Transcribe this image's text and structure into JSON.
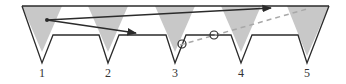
{
  "diagram": {
    "labels": [
      {
        "text": "1",
        "x": 42
      },
      {
        "text": "2",
        "x": 108
      },
      {
        "text": "3",
        "x": 175
      },
      {
        "text": "4",
        "x": 241
      },
      {
        "text": "5",
        "x": 307
      }
    ],
    "colors": {
      "outline": "#2b2b2b",
      "shade": "#c8c8c8",
      "dashed": "#a8a8a8"
    }
  }
}
